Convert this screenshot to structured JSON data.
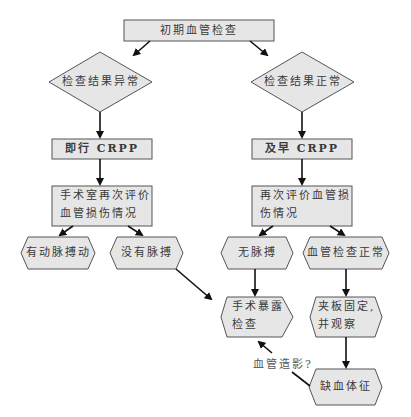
{
  "diagram": {
    "type": "flowchart",
    "nodes": {
      "start": "初期血管检查",
      "abnormal": "检查结果异常",
      "normal": "检查结果正常",
      "crpp_now": "即行 CRPP",
      "crpp_early": "及早 CRPP",
      "reassess_or_l1": "手术室再次评价",
      "reassess_or_l2": "血管损伤情况",
      "reassess_l1": "再次评价血管损",
      "reassess_l2": "伤情况",
      "pulse_present": "有动脉搏动",
      "no_pulse_left": "没有脉搏",
      "no_pulse_right": "无脉搏",
      "vessel_normal": "血管检查正常",
      "explore_l1": "手术暴露",
      "explore_l2": "检查",
      "splint_l1": "夹板固定,",
      "splint_l2": "并观察",
      "ischemia": "缺血体征"
    },
    "edge_labels": {
      "angiography": "血管造影?"
    },
    "colors": {
      "box_fill": "#e6e6e6",
      "stroke": "#555555",
      "arrow": "#111111"
    }
  }
}
